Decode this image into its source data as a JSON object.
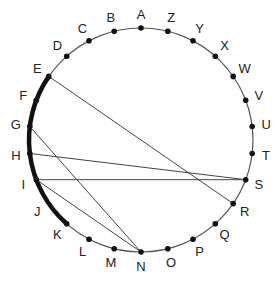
{
  "diagram": {
    "type": "circle-with-chords",
    "center": [
      141,
      140
    ],
    "radius": 112,
    "label_offset": 14,
    "colors": {
      "circle": "#555555",
      "chord": "#444444",
      "dot": "#111111",
      "thick_arc": "#111111",
      "label": "#222222"
    },
    "points": [
      {
        "label": "A",
        "x": 141.0,
        "y": 28.0
      },
      {
        "label": "B",
        "x": 114.2,
        "y": 31.3
      },
      {
        "label": "C",
        "x": 89.0,
        "y": 40.8
      },
      {
        "label": "D",
        "x": 66.7,
        "y": 56.2
      },
      {
        "label": "E",
        "x": 48.8,
        "y": 76.4
      },
      {
        "label": "F",
        "x": 36.3,
        "y": 100.3
      },
      {
        "label": "G",
        "x": 29.8,
        "y": 126.5
      },
      {
        "label": "H",
        "x": 29.8,
        "y": 153.5
      },
      {
        "label": "I",
        "x": 36.3,
        "y": 179.7
      },
      {
        "label": "J",
        "x": 48.8,
        "y": 203.6
      },
      {
        "label": "K",
        "x": 66.7,
        "y": 223.8
      },
      {
        "label": "L",
        "x": 89.0,
        "y": 239.2
      },
      {
        "label": "M",
        "x": 114.2,
        "y": 248.7
      },
      {
        "label": "N",
        "x": 141.0,
        "y": 252.0
      },
      {
        "label": "O",
        "x": 167.8,
        "y": 248.7
      },
      {
        "label": "P",
        "x": 193.0,
        "y": 239.2
      },
      {
        "label": "Q",
        "x": 215.3,
        "y": 223.8
      },
      {
        "label": "R",
        "x": 233.2,
        "y": 203.6
      },
      {
        "label": "S",
        "x": 245.7,
        "y": 179.7
      },
      {
        "label": "T",
        "x": 252.2,
        "y": 153.5
      },
      {
        "label": "U",
        "x": 252.2,
        "y": 126.5
      },
      {
        "label": "V",
        "x": 245.7,
        "y": 100.3
      },
      {
        "label": "W",
        "x": 233.2,
        "y": 76.4
      },
      {
        "label": "X",
        "x": 215.3,
        "y": 56.2
      },
      {
        "label": "Y",
        "x": 193.0,
        "y": 40.8
      },
      {
        "label": "Z",
        "x": 167.8,
        "y": 31.3
      }
    ],
    "chords": [
      {
        "from": "E",
        "to": "R"
      },
      {
        "from": "G",
        "to": "N"
      },
      {
        "from": "H",
        "to": "S"
      },
      {
        "from": "I",
        "to": "S"
      },
      {
        "from": "I",
        "to": "N"
      }
    ],
    "thick_arc": {
      "from": "E",
      "to": "K"
    },
    "points_without_dot": [
      "J"
    ]
  }
}
